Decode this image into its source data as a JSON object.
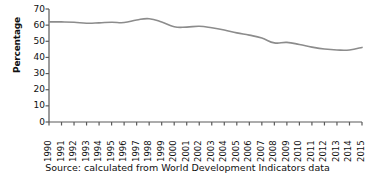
{
  "chart_data": {
    "type": "line",
    "title": "",
    "xlabel": "",
    "ylabel": "Percentage",
    "ylim": [
      0,
      70
    ],
    "ytick_values": [
      0,
      10,
      20,
      30,
      40,
      50,
      60,
      70
    ],
    "ytick_labels": [
      "0",
      "10",
      "20",
      "30",
      "40",
      "50",
      "60",
      "70"
    ],
    "grid": false,
    "legend": "none",
    "line_color": "#8c8c8c",
    "axis_color": "#5a5a5a",
    "categories": [
      "1990",
      "1991",
      "1992",
      "1993",
      "1994",
      "1995",
      "1996",
      "1997",
      "1998",
      "1999",
      "2000",
      "2001",
      "2002",
      "2003",
      "2004",
      "2005",
      "2006",
      "2007",
      "2008",
      "2009",
      "2010",
      "2011",
      "2012",
      "2013",
      "2014",
      "2015"
    ],
    "series": [
      {
        "name": "Percentage",
        "values": [
          62.0,
          62.0,
          61.8,
          61.2,
          61.4,
          61.8,
          61.6,
          63.2,
          64.0,
          62.0,
          59.0,
          58.8,
          59.3,
          58.4,
          57.0,
          55.2,
          53.8,
          52.0,
          49.0,
          49.3,
          48.0,
          46.4,
          45.2,
          44.6,
          44.6,
          46.2
        ]
      }
    ]
  },
  "source": {
    "text": "Source: calculated from World Development Indicators data"
  }
}
